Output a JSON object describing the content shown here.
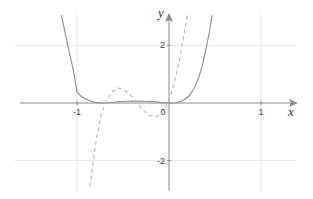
{
  "chart_data": {
    "type": "line",
    "title": "",
    "xlabel": "x",
    "ylabel": "y",
    "xlim": [
      -1.62,
      1.38
    ],
    "ylim": [
      -3.0,
      3.1
    ],
    "grid": true,
    "x_ticks": [
      {
        "value": -1,
        "label": "-1"
      },
      {
        "value": 0,
        "label": "0"
      },
      {
        "value": 1,
        "label": "1"
      }
    ],
    "y_ticks": [
      {
        "value": 2,
        "label": "2"
      },
      {
        "value": -2,
        "label": "-2"
      }
    ],
    "x_gridlines": [
      -1,
      1
    ],
    "y_gridlines": [
      2,
      -2
    ],
    "series": [
      {
        "name": "f(x)",
        "style": "solid",
        "color": "#8c8c8c",
        "points": [
          [
            -1.17,
            3.05
          ],
          [
            -1.12,
            2.3
          ],
          [
            -1.08,
            1.7
          ],
          [
            -1.04,
            1.15
          ],
          [
            -1.0,
            0.38
          ],
          [
            -0.95,
            0.22
          ],
          [
            -0.9,
            0.14
          ],
          [
            -0.85,
            0.07
          ],
          [
            -0.8,
            0.02
          ],
          [
            -0.75,
            0.0
          ],
          [
            -0.7,
            0.0
          ],
          [
            -0.65,
            0.01
          ],
          [
            -0.55,
            0.04
          ],
          [
            -0.45,
            0.06
          ],
          [
            -0.35,
            0.07
          ],
          [
            -0.25,
            0.06
          ],
          [
            -0.15,
            0.04
          ],
          [
            -0.08,
            0.015
          ],
          [
            0.0,
            0.0
          ],
          [
            0.08,
            0.01
          ],
          [
            0.15,
            0.08
          ],
          [
            0.22,
            0.25
          ],
          [
            0.28,
            0.55
          ],
          [
            0.33,
            0.95
          ],
          [
            0.37,
            1.4
          ],
          [
            0.41,
            2.0
          ],
          [
            0.44,
            2.5
          ],
          [
            0.47,
            3.05
          ]
        ]
      },
      {
        "name": "f'(x)",
        "style": "dashed",
        "color": "#b5b5b5",
        "points": [
          [
            -0.86,
            -2.9
          ],
          [
            -0.82,
            -1.9
          ],
          [
            -0.78,
            -1.1
          ],
          [
            -0.74,
            -0.45
          ],
          [
            -0.7,
            -0.05
          ],
          [
            -0.67,
            0.15
          ],
          [
            -0.62,
            0.38
          ],
          [
            -0.55,
            0.52
          ],
          [
            -0.48,
            0.45
          ],
          [
            -0.4,
            0.2
          ],
          [
            -0.33,
            -0.05
          ],
          [
            -0.28,
            -0.25
          ],
          [
            -0.22,
            -0.42
          ],
          [
            -0.15,
            -0.49
          ],
          [
            -0.09,
            -0.4
          ],
          [
            -0.04,
            -0.15
          ],
          [
            0.0,
            0.1
          ],
          [
            0.04,
            0.5
          ],
          [
            0.08,
            1.0
          ],
          [
            0.12,
            1.6
          ],
          [
            0.16,
            2.3
          ],
          [
            0.2,
            3.05
          ]
        ]
      }
    ]
  }
}
